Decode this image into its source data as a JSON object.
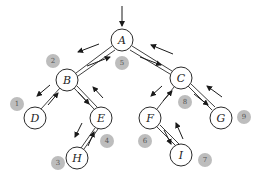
{
  "diagram": {
    "type": "binary-tree-traversal",
    "colors": {
      "node_stroke": "#2a2a2a",
      "node_fill": "#ffffff",
      "badge_fill": "#bdbdbd",
      "badge_text": "#555555"
    },
    "nodes": [
      {
        "id": "A",
        "label": "A",
        "x": 122,
        "y": 40
      },
      {
        "id": "B",
        "label": "B",
        "x": 67,
        "y": 80
      },
      {
        "id": "C",
        "label": "C",
        "x": 181,
        "y": 78
      },
      {
        "id": "D",
        "label": "D",
        "x": 35,
        "y": 118
      },
      {
        "id": "E",
        "label": "E",
        "x": 101,
        "y": 118
      },
      {
        "id": "F",
        "label": "F",
        "x": 150,
        "y": 118
      },
      {
        "id": "G",
        "label": "G",
        "x": 221,
        "y": 118
      },
      {
        "id": "H",
        "label": "H",
        "x": 77,
        "y": 158
      },
      {
        "id": "I",
        "label": "I",
        "x": 181,
        "y": 155
      }
    ],
    "edges": [
      [
        "A",
        "B"
      ],
      [
        "A",
        "C"
      ],
      [
        "B",
        "D"
      ],
      [
        "B",
        "E"
      ],
      [
        "E",
        "H"
      ],
      [
        "C",
        "F"
      ],
      [
        "C",
        "G"
      ],
      [
        "F",
        "I"
      ]
    ],
    "badges": [
      {
        "label": "1",
        "x": 17,
        "y": 104
      },
      {
        "label": "2",
        "x": 53,
        "y": 61
      },
      {
        "label": "3",
        "x": 58,
        "y": 163
      },
      {
        "label": "4",
        "x": 107,
        "y": 141
      },
      {
        "label": "5",
        "x": 122,
        "y": 63
      },
      {
        "label": "6",
        "x": 145,
        "y": 141
      },
      {
        "label": "7",
        "x": 205,
        "y": 160
      },
      {
        "label": "8",
        "x": 185,
        "y": 102
      },
      {
        "label": "9",
        "x": 244,
        "y": 117
      }
    ],
    "labels": {
      "A": "A",
      "B": "B",
      "C": "C",
      "D": "D",
      "E": "E",
      "F": "F",
      "G": "G",
      "H": "H",
      "I": "I",
      "b1": "1",
      "b2": "2",
      "b3": "3",
      "b4": "4",
      "b5": "5",
      "b6": "6",
      "b7": "7",
      "b8": "8",
      "b9": "9"
    }
  }
}
